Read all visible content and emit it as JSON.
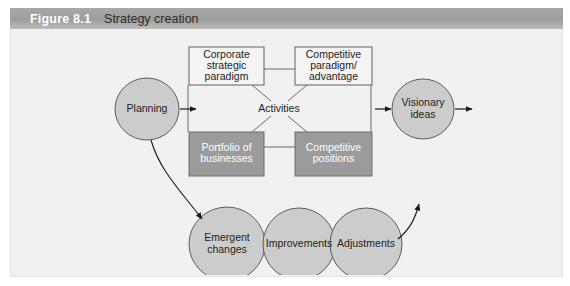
{
  "figure": {
    "number": "Figure 8.1",
    "title": "Strategy creation",
    "header_bg": "#a0a0a0",
    "body_bg": "#f1f1f1"
  },
  "diagram": {
    "type": "flow-diagram",
    "center_label": "Activities",
    "boxes": [
      {
        "id": "corporate-strategic-paradigm",
        "line1": "Corporate",
        "line2": "strategic",
        "line3": "paradigm",
        "fill": "#f4f4f4",
        "text_color": "#1d1d1d"
      },
      {
        "id": "competitive-paradigm-advantage",
        "line1": "Competitive",
        "line2": "paradigm/",
        "line3": "advantage",
        "fill": "#f4f4f4",
        "text_color": "#1d1d1d"
      },
      {
        "id": "portfolio-of-businesses",
        "line1": "Portfolio of",
        "line2": "businesses",
        "line3": "",
        "fill": "#9b9b9b",
        "text_color": "#ffffff"
      },
      {
        "id": "competitive-positions",
        "line1": "Competitive",
        "line2": "positions",
        "line3": "",
        "fill": "#9b9b9b",
        "text_color": "#ffffff"
      }
    ],
    "nodes": [
      {
        "id": "planning",
        "line1": "Planning",
        "line2": "",
        "fill": "#cccccc"
      },
      {
        "id": "visionary-ideas",
        "line1": "Visionary",
        "line2": "ideas",
        "fill": "#cccccc"
      },
      {
        "id": "emergent-changes",
        "line1": "Emergent",
        "line2": "changes",
        "fill": "#cccccc"
      },
      {
        "id": "improvements",
        "line1": "Improvements",
        "line2": "",
        "fill": "#cccccc"
      },
      {
        "id": "adjustments",
        "line1": "Adjustments",
        "line2": "",
        "fill": "#cccccc"
      }
    ]
  }
}
